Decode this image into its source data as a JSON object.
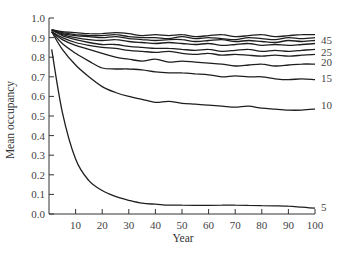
{
  "chart_data": {
    "type": "line",
    "title": "",
    "xlabel": "Year",
    "ylabel": "Mean occupancy",
    "xlim": [
      0,
      100
    ],
    "ylim": [
      0.0,
      1.0
    ],
    "grid": false,
    "legend_position": "inline-right",
    "x_ticks": [
      10,
      20,
      30,
      40,
      50,
      60,
      70,
      80,
      90,
      100
    ],
    "x_tick_labels": [
      "10",
      "20",
      "30",
      "40",
      "50",
      "60",
      "70",
      "80",
      "90",
      "100"
    ],
    "y_ticks": [
      0.0,
      0.1,
      0.2,
      0.3,
      0.4,
      0.5,
      0.6,
      0.7,
      0.8,
      0.9,
      1.0
    ],
    "y_tick_labels": [
      "0.0",
      "0.1",
      "0.2",
      "0.3",
      "0.4",
      "0.5",
      "0.6",
      "0.7",
      "0.8",
      "0.9",
      "1.0"
    ],
    "x": [
      1,
      5,
      10,
      15,
      20,
      25,
      30,
      35,
      40,
      45,
      50,
      55,
      60,
      65,
      70,
      75,
      80,
      85,
      90,
      95,
      100
    ],
    "series": [
      {
        "name": "45",
        "label": "45",
        "values": [
          0.94,
          0.93,
          0.925,
          0.92,
          0.92,
          0.925,
          0.92,
          0.91,
          0.915,
          0.91,
          0.915,
          0.905,
          0.91,
          0.915,
          0.905,
          0.91,
          0.915,
          0.905,
          0.91,
          0.915,
          0.915
        ]
      },
      {
        "name": "40",
        "label": "",
        "values": [
          0.94,
          0.925,
          0.915,
          0.91,
          0.91,
          0.915,
          0.905,
          0.9,
          0.9,
          0.895,
          0.905,
          0.895,
          0.9,
          0.895,
          0.89,
          0.9,
          0.895,
          0.89,
          0.9,
          0.895,
          0.9
        ]
      },
      {
        "name": "35",
        "label": "",
        "values": [
          0.94,
          0.92,
          0.91,
          0.905,
          0.9,
          0.905,
          0.895,
          0.89,
          0.885,
          0.89,
          0.89,
          0.88,
          0.885,
          0.89,
          0.88,
          0.885,
          0.88,
          0.875,
          0.885,
          0.88,
          0.885
        ]
      },
      {
        "name": "30",
        "label": "",
        "values": [
          0.94,
          0.915,
          0.9,
          0.89,
          0.885,
          0.89,
          0.88,
          0.875,
          0.87,
          0.875,
          0.87,
          0.865,
          0.87,
          0.86,
          0.865,
          0.87,
          0.86,
          0.865,
          0.86,
          0.865,
          0.87
        ]
      },
      {
        "name": "25",
        "label": "25",
        "values": [
          0.94,
          0.91,
          0.89,
          0.875,
          0.865,
          0.865,
          0.855,
          0.85,
          0.845,
          0.845,
          0.84,
          0.835,
          0.84,
          0.83,
          0.835,
          0.84,
          0.83,
          0.835,
          0.83,
          0.835,
          0.84
        ]
      },
      {
        "name": "22",
        "label": "",
        "values": [
          0.93,
          0.9,
          0.875,
          0.86,
          0.85,
          0.845,
          0.835,
          0.83,
          0.825,
          0.83,
          0.82,
          0.815,
          0.82,
          0.81,
          0.815,
          0.81,
          0.805,
          0.81,
          0.805,
          0.81,
          0.815
        ]
      },
      {
        "name": "20",
        "label": "20",
        "values": [
          0.93,
          0.89,
          0.86,
          0.84,
          0.82,
          0.8,
          0.79,
          0.78,
          0.79,
          0.775,
          0.78,
          0.775,
          0.77,
          0.765,
          0.755,
          0.76,
          0.765,
          0.755,
          0.76,
          0.765,
          0.765
        ]
      },
      {
        "name": "15",
        "label": "15",
        "values": [
          0.93,
          0.87,
          0.82,
          0.78,
          0.745,
          0.74,
          0.74,
          0.735,
          0.725,
          0.72,
          0.72,
          0.715,
          0.71,
          0.7,
          0.705,
          0.7,
          0.7,
          0.69,
          0.685,
          0.69,
          0.685
        ]
      },
      {
        "name": "10",
        "label": "10",
        "values": [
          0.93,
          0.84,
          0.76,
          0.7,
          0.65,
          0.62,
          0.6,
          0.585,
          0.57,
          0.575,
          0.565,
          0.56,
          0.555,
          0.55,
          0.545,
          0.55,
          0.54,
          0.535,
          0.53,
          0.53,
          0.535
        ]
      },
      {
        "name": "5",
        "label": "5",
        "values": [
          0.84,
          0.52,
          0.28,
          0.17,
          0.12,
          0.09,
          0.07,
          0.055,
          0.05,
          0.045,
          0.045,
          0.044,
          0.044,
          0.045,
          0.045,
          0.044,
          0.043,
          0.042,
          0.04,
          0.035,
          0.03
        ]
      }
    ]
  },
  "layout": {
    "plot_left": 49,
    "plot_right": 315,
    "plot_top": 18,
    "plot_bottom": 214,
    "line_color": "#1e1e1e",
    "axis_color": "#333333"
  }
}
